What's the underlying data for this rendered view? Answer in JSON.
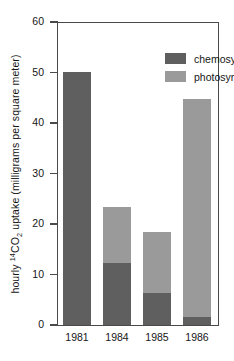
{
  "chart_data": {
    "type": "bar",
    "subtype": "stacked",
    "title": "",
    "subtitle": "",
    "xlabel": "",
    "ylabel": "hourly 14CO2 uptake (milligrams per square meter)",
    "ylabel_parts": {
      "prefix": "hourly ",
      "superscript": "14",
      "element": "CO",
      "subscript": "2",
      "suffix": " uptake (milligrams per square meter)"
    },
    "categories": [
      "1981",
      "1984",
      "1985",
      "1986"
    ],
    "series": [
      {
        "name": "chemosynthesis",
        "color": "#5f5f5f",
        "values": [
          50.2,
          12.3,
          6.4,
          1.5
        ]
      },
      {
        "name": "photosynthesis",
        "color": "#9a9a9a",
        "values": [
          0,
          11.0,
          12.0,
          43.3
        ]
      }
    ],
    "totals": [
      50.2,
      23.3,
      18.4,
      44.8
    ],
    "ylim": [
      0,
      60
    ],
    "yticks": [
      0,
      10,
      20,
      30,
      40,
      50,
      60
    ],
    "ytick_labels": [
      "0",
      "10",
      "20",
      "30",
      "40",
      "50",
      "60"
    ],
    "grid": false,
    "legend_position": "top-center",
    "legend": [
      {
        "label": "chemosynthesis",
        "color": "#5f5f5f"
      },
      {
        "label": "photosynthesis",
        "color": "#9a9a9a"
      }
    ]
  },
  "axis": {
    "frame_color": "#4a4a4a"
  }
}
